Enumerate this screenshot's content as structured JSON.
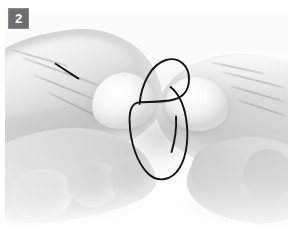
{
  "figure": {
    "kind": "instructional-photo",
    "color_mode": "grayscale",
    "width": 294,
    "height": 239
  },
  "badge": {
    "step_number": "2",
    "background_color": "#6e6e6e",
    "text_color": "#ffffff",
    "border_color": "#8a8a8a"
  },
  "photo": {
    "background_color": "#f4f4f4",
    "frame_color": "#ffffff",
    "subjects": [
      {
        "name": "left-hand",
        "position": "enters from left edge",
        "tone": "#cfcfcf"
      },
      {
        "name": "right-hand",
        "position": "enters from right edge",
        "tone": "#d2d2d2"
      }
    ]
  },
  "annotations": {
    "ink_color": "#141414",
    "stroke_width": 1.9,
    "marks": [
      {
        "name": "pointer-line",
        "shape": "short diagonal line",
        "location": "left thumb, upper area",
        "from": [
          55,
          64
        ],
        "to": [
          79,
          79
        ]
      },
      {
        "name": "loop-annotation",
        "shape": "hand-drawn spiral loop with upper arch and lower oval",
        "location": "center, at the point where the fingertips meet",
        "bounds": [
          129,
          59,
          58,
          122
        ]
      },
      {
        "name": "tail-stroke",
        "shape": "short curved tail inside the oval",
        "from": [
          175,
          117
        ],
        "to": [
          172,
          152
        ]
      }
    ]
  }
}
